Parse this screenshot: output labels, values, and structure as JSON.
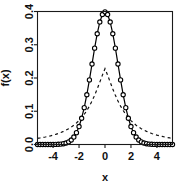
{
  "chart_data": {
    "type": "line",
    "title": "",
    "subtitle": "",
    "xlabel": "x",
    "ylabel": "f(x)",
    "xlim": [
      -5.2,
      5.2
    ],
    "ylim": [
      0.0,
      0.4
    ],
    "xticks": [
      -4,
      -2,
      0,
      2,
      4
    ],
    "xticklabels": [
      "-4",
      "-2",
      "0",
      "2",
      "4"
    ],
    "yticks": [
      0.0,
      0.1,
      0.2,
      0.3,
      0.4
    ],
    "yticklabels": [
      "0.0",
      "0.1",
      "0.2",
      "0.3",
      "0.4"
    ],
    "grid": false,
    "legend": null,
    "frame": "box",
    "series": [
      {
        "name": "solid-with-circles",
        "style": "solid",
        "marker": "open-circle",
        "color": "#000000",
        "linewidth": 1.2,
        "markersize": 3.4,
        "x": [
          -5.2,
          -5.0,
          -4.8,
          -4.6,
          -4.4,
          -4.2,
          -4.0,
          -3.8,
          -3.6,
          -3.4,
          -3.2,
          -3.0,
          -2.8,
          -2.6,
          -2.4,
          -2.2,
          -2.0,
          -1.8,
          -1.6,
          -1.4,
          -1.2,
          -1.0,
          -0.8,
          -0.6,
          -0.4,
          -0.2,
          0.0,
          0.2,
          0.4,
          0.6,
          0.8,
          1.0,
          1.2,
          1.4,
          1.6,
          1.8,
          2.0,
          2.2,
          2.4,
          2.6,
          2.8,
          3.0,
          3.2,
          3.4,
          3.6,
          3.8,
          4.0,
          4.2,
          4.4,
          4.6,
          4.8,
          5.0,
          5.2
        ],
        "y": [
          0.0,
          0.0,
          0.0,
          0.0,
          0.0,
          0.0001,
          0.0001,
          0.0003,
          0.0006,
          0.0012,
          0.0024,
          0.0044,
          0.0079,
          0.0136,
          0.0224,
          0.0355,
          0.054,
          0.079,
          0.1109,
          0.1497,
          0.1942,
          0.242,
          0.2897,
          0.3332,
          0.3683,
          0.391,
          0.3989,
          0.391,
          0.3683,
          0.3332,
          0.2897,
          0.242,
          0.1942,
          0.1497,
          0.1109,
          0.079,
          0.054,
          0.0355,
          0.0224,
          0.0136,
          0.0079,
          0.0044,
          0.0024,
          0.0012,
          0.0006,
          0.0003,
          0.0001,
          0.0001,
          0.0,
          0.0,
          0.0,
          0.0,
          0.0
        ]
      },
      {
        "name": "dashed",
        "style": "dashed",
        "marker": "none",
        "color": "#111111",
        "linewidth": 1.2,
        "dasharray": "3,3",
        "x": [
          -5.2,
          -5.0,
          -4.8,
          -4.6,
          -4.4,
          -4.2,
          -4.0,
          -3.8,
          -3.6,
          -3.4,
          -3.2,
          -3.0,
          -2.8,
          -2.6,
          -2.4,
          -2.2,
          -2.0,
          -1.8,
          -1.6,
          -1.4,
          -1.2,
          -1.0,
          -0.8,
          -0.6,
          -0.4,
          -0.2,
          0.0,
          0.2,
          0.4,
          0.6,
          0.8,
          1.0,
          1.2,
          1.4,
          1.6,
          1.8,
          2.0,
          2.2,
          2.4,
          2.6,
          2.8,
          3.0,
          3.2,
          3.4,
          3.6,
          3.8,
          4.0,
          4.2,
          4.4,
          4.6,
          4.8,
          5.0,
          5.2
        ],
        "y": [
          0.0185,
          0.0197,
          0.0211,
          0.0226,
          0.0243,
          0.0261,
          0.0282,
          0.0305,
          0.0331,
          0.0361,
          0.0394,
          0.0432,
          0.0475,
          0.0524,
          0.058,
          0.0645,
          0.072,
          0.0806,
          0.0906,
          0.1021,
          0.1154,
          0.1306,
          0.1478,
          0.167,
          0.1877,
          0.2087,
          0.228,
          0.2087,
          0.1877,
          0.167,
          0.1478,
          0.1306,
          0.1154,
          0.1021,
          0.0906,
          0.0806,
          0.072,
          0.0645,
          0.058,
          0.0524,
          0.0475,
          0.0432,
          0.0394,
          0.0361,
          0.0331,
          0.0305,
          0.0282,
          0.0261,
          0.0243,
          0.0226,
          0.0211,
          0.0197,
          0.0185
        ]
      }
    ]
  },
  "colors": {
    "background": "#ffffff",
    "foreground": "#000000",
    "axis": "#1a1a1a"
  }
}
